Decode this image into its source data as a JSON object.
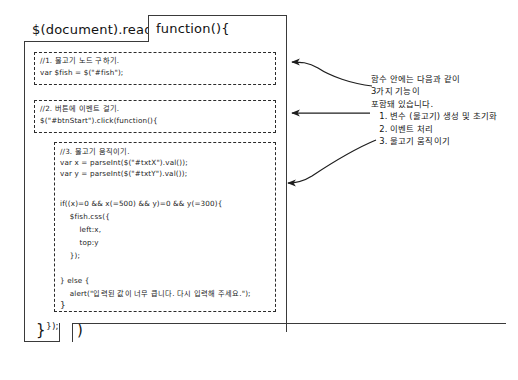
{
  "diagram": {
    "title_left": "$(document).ready(",
    "function_box_label": "function(){",
    "closing_brace": "}",
    "closing_paren": ")",
    "inner_close_ready": "});",
    "inner_close_click": "}",
    "blocks": [
      {
        "id": "block-1-variable",
        "lines": [
          "//1. 물고기 노드 구하기.",
          "var $fish = $(\"#fish\");"
        ]
      },
      {
        "id": "block-2-event",
        "lines": [
          "//2. 버튼에 이벤트 걸기.",
          "$(\"#btnStart\").click(function(){"
        ]
      },
      {
        "id": "block-3-move",
        "lines": [
          "//3. 물고기 움직이기.",
          "var x = parseInt($(\"#txtX\").val());",
          "var y = parseInt($(\"#txtY\").val());",
          "",
          "if((x)=0 && x(=500) && y)=0 && y(=300){",
          "    $fish.css({",
          "        left:x,",
          "        top:y",
          "    });",
          "",
          "} else {",
          "    alert(\"입력된 값이 너무 큽니다. 다시 입력해 주세요.\");"
        ]
      }
    ],
    "annotation": {
      "lines": [
        "함수 안에는 다음과 같이",
        "3가지 기능이",
        "포함돼 있습니다.",
        "   1. 변수 (물고기) 생성 및 초기화",
        "   2. 이벤트 처리",
        "   3. 물고기 움직이기"
      ]
    },
    "colors": {
      "ink": "#2b2b2b",
      "paper": "#ffffff",
      "dash": "#2b2b2b"
    }
  }
}
